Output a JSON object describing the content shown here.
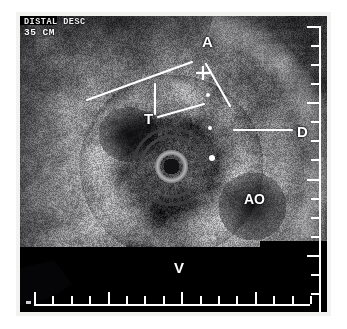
{
  "image": {
    "modality": "intravascular-ultrasound",
    "width": 347,
    "height": 329,
    "background_color": "#ffffff",
    "field_color": "#07070a",
    "bezel_color": "#f2f2f0",
    "annotation_color": "#ffffff"
  },
  "header": {
    "line1": "DISTAL DESC",
    "line2": "35 CM"
  },
  "labels": {
    "a": "A",
    "t": "T",
    "d": "D",
    "ao": "AO",
    "v": "V"
  },
  "rulers": {
    "vertical": {
      "tick_count": 16,
      "major_every": 4,
      "position": "right"
    },
    "horizontal": {
      "tick_count": 16,
      "major_every": 4,
      "position": "bottom"
    }
  },
  "leader_lines": [
    {
      "name": "a-left",
      "x1": 67,
      "y1": 84,
      "x2": 172,
      "y2": 46
    },
    {
      "name": "a-right",
      "x1": 186,
      "y1": 48,
      "x2": 210,
      "y2": 90
    },
    {
      "name": "t-vertical",
      "x1": 135,
      "y1": 68,
      "x2": 135,
      "y2": 98
    },
    {
      "name": "t-horizontal",
      "x1": 138,
      "y1": 101,
      "x2": 184,
      "y2": 88
    },
    {
      "name": "d-pointer",
      "x1": 214,
      "y1": 114,
      "x2": 272,
      "y2": 114
    }
  ],
  "caliper_marks": [
    {
      "name": "cross-upper",
      "shape": "plus",
      "x": 183,
      "y": 57,
      "size": 7
    },
    {
      "name": "dot-upper",
      "shape": "dot",
      "x": 188,
      "y": 79,
      "size": 2
    },
    {
      "name": "dot-middle",
      "shape": "dot",
      "x": 190,
      "y": 112,
      "size": 2
    },
    {
      "name": "dot-lower",
      "shape": "dot",
      "x": 192,
      "y": 142,
      "size": 3
    }
  ],
  "catheter_ring": {
    "center_x": 151,
    "center_y": 150,
    "inner_radius": 9,
    "ring_radius": 14,
    "outer_halo_radius": 38,
    "ring_color": "#b9b7ae"
  },
  "anatomy_notes": {
    "a": "azygos / arterial structure",
    "t": "tumor",
    "d": "descending plane marker",
    "ao": "aorta",
    "v": "vertebra"
  }
}
